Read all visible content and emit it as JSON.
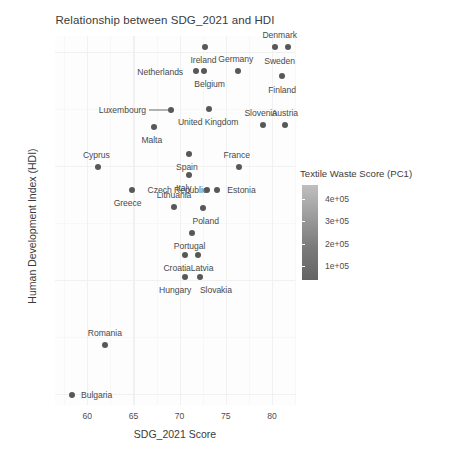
{
  "chart_data": {
    "type": "scatter",
    "title": "Relationship between SDG_2021 and HDI",
    "xlabel": "SDG_2021 Score",
    "ylabel": "Human Development Index (HDI)",
    "xlim": [
      56.5,
      82.5
    ],
    "ylim": [
      0.795,
      0.957
    ],
    "xticks": [
      60,
      65,
      70,
      75,
      80
    ],
    "xticklabels": [
      "60",
      "65",
      "70",
      "75",
      "80"
    ],
    "yticks": [
      0.8,
      0.85,
      0.9,
      0.95
    ],
    "yticklabels": [
      "0.80",
      "0.85",
      "0.90",
      "0.95"
    ],
    "grid": true,
    "legend": {
      "title": "Textile Waste Score (PC1)",
      "position": "right",
      "type": "colorbar",
      "scale": "grayscale-continuous",
      "ticks": [
        100000,
        200000,
        300000,
        400000
      ],
      "ticklabels": [
        "1e+05",
        "2e+05",
        "3e+05",
        "4e+05"
      ],
      "color_low": "#646464",
      "color_high": "#bfbfbf"
    },
    "point_color": "#585858",
    "points": [
      {
        "name": "Ireland",
        "x": 72.8,
        "y": 0.952,
        "label_dx": -2,
        "label_dy": 13
      },
      {
        "name": "Denmark",
        "x": 80.3,
        "y": 0.952,
        "label_dx": 5,
        "label_dy": -12
      },
      {
        "name": "Sweden",
        "x": 81.7,
        "y": 0.952,
        "label_dx": -8,
        "label_dy": 14
      },
      {
        "name": "Germany",
        "x": 76.3,
        "y": 0.9415,
        "label_dx": -2,
        "label_dy": -12
      },
      {
        "name": "Netherlands",
        "x": 71.8,
        "y": 0.9415,
        "label_dx": -36,
        "label_dy": 1
      },
      {
        "name": "Belgium",
        "x": 72.6,
        "y": 0.9415,
        "label_dx": 6,
        "label_dy": 13
      },
      {
        "name": "Finland",
        "x": 81.1,
        "y": 0.9395,
        "label_dx": 0,
        "label_dy": 14
      },
      {
        "name": "Luxembourg",
        "x": 69.1,
        "y": 0.9245,
        "label_dx": -49,
        "label_dy": 0
      },
      {
        "name": "United Kingdom",
        "x": 73.2,
        "y": 0.925,
        "label_dx": -1,
        "label_dy": 13
      },
      {
        "name": "Slovenia",
        "x": 79.0,
        "y": 0.918,
        "label_dx": -2,
        "label_dy": -12
      },
      {
        "name": "Austria",
        "x": 81.4,
        "y": 0.918,
        "label_dx": 0,
        "label_dy": -12
      },
      {
        "name": "Malta",
        "x": 67.2,
        "y": 0.917,
        "label_dx": -2,
        "label_dy": 13
      },
      {
        "name": "Spain",
        "x": 71.0,
        "y": 0.905,
        "label_dx": -2,
        "label_dy": 13
      },
      {
        "name": "France",
        "x": 76.4,
        "y": 0.8995,
        "label_dx": -2,
        "label_dy": -12
      },
      {
        "name": "Cyprus",
        "x": 61.2,
        "y": 0.8995,
        "label_dx": -2,
        "label_dy": -12
      },
      {
        "name": "Italy",
        "x": 71.0,
        "y": 0.896,
        "label_dx": -5,
        "label_dy": 13
      },
      {
        "name": "Czech Republic",
        "x": 73.0,
        "y": 0.8895,
        "label_dx": -30,
        "label_dy": 0
      },
      {
        "name": "Estonia",
        "x": 74.0,
        "y": 0.8895,
        "label_dx": 25,
        "label_dy": 0
      },
      {
        "name": "Greece",
        "x": 64.8,
        "y": 0.8895,
        "label_dx": -4,
        "label_dy": 13
      },
      {
        "name": "Lithuania",
        "x": 69.4,
        "y": 0.882,
        "label_dx": 0,
        "label_dy": -12
      },
      {
        "name": "Poland",
        "x": 72.5,
        "y": 0.8815,
        "label_dx": 3,
        "label_dy": 13
      },
      {
        "name": "Portugal",
        "x": 71.3,
        "y": 0.8705,
        "label_dx": -2,
        "label_dy": 13
      },
      {
        "name": "Croatia",
        "x": 70.6,
        "y": 0.861,
        "label_dx": -8,
        "label_dy": 13
      },
      {
        "name": "Latvia",
        "x": 72.0,
        "y": 0.861,
        "label_dx": 4,
        "label_dy": 13
      },
      {
        "name": "Hungary",
        "x": 70.6,
        "y": 0.851,
        "label_dx": -10,
        "label_dy": 13
      },
      {
        "name": "Slovakia",
        "x": 72.2,
        "y": 0.851,
        "label_dx": 16,
        "label_dy": 13
      },
      {
        "name": "Romania",
        "x": 61.9,
        "y": 0.8215,
        "label_dx": 0,
        "label_dy": -12
      },
      {
        "name": "Bulgaria",
        "x": 58.3,
        "y": 0.7995,
        "label_dx": 25,
        "label_dy": 0
      }
    ]
  },
  "footer": {
    "note": ""
  }
}
